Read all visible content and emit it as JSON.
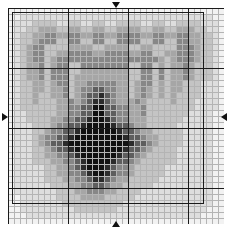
{
  "document": {
    "title": "Cross Stitch Pattern Chart",
    "kind": "counted-cross-stitch-grid-chart"
  },
  "grid": {
    "columns": 36,
    "rows": 36,
    "cell_size_px": 6,
    "origin_x_px": 8,
    "origin_y_px": 8,
    "bold_line_every": 10,
    "thin_line_color": "#b4b4b4",
    "bold_line_color": "#1a1a1a",
    "background_color": "#ffffff"
  },
  "design_box": {
    "left_px": 20,
    "top_px": 20,
    "width_px": 192,
    "height_px": 192,
    "border_color": "#1a1a1a",
    "label": "design-border"
  },
  "center_markers": {
    "top": {
      "direction": "down",
      "label": "center-column-marker-top"
    },
    "bottom": {
      "direction": "up",
      "label": "center-column-marker-bottom"
    },
    "left": {
      "direction": "right",
      "label": "center-row-marker-left"
    },
    "right": {
      "direction": "left",
      "label": "center-row-marker-right"
    }
  },
  "palette": {
    "0": "#ffffff",
    "1": "#f2f2f2",
    "2": "#dedede",
    "3": "#c4c4c4",
    "4": "#a6a6a6",
    "5": "#878787",
    "6": "#5e5e5e",
    "7": "#2b2b2b",
    "8": "#111111"
  },
  "palette_names": {
    "0": "white",
    "1": "near-white",
    "2": "very-light-gray",
    "3": "light-gray",
    "4": "mid-light-gray",
    "5": "mid-gray",
    "6": "dark-gray",
    "7": "very-dark-gray",
    "8": "black"
  },
  "chart_data": {
    "type": "heatmap",
    "xlabel": "",
    "ylabel": "",
    "grid": true,
    "legend": "none",
    "shades": 9,
    "rows": [
      "111111111111111111111111111111111111",
      "112222222222222222222222222222222211",
      "122233332233223322333322332233332221",
      "122334443344334433444433443344433221",
      "123344554455445544555544554455443321",
      "123345553355335533555533553355443321",
      "123455333344443344443344333355543321",
      "123455334455554455554455334455543321",
      "123455345555555555555555543455543321",
      "123445345533555555553355343445433321",
      "123445355533444444443355353445433321",
      "123445355534444444443355353445433321",
      "123344345534455555443455343443332221",
      "123344344534556655443454343443332221",
      "123343344534566765443454343433332221",
      "123343334454567765444543333433322221",
      "123333334455668866554453333333322221",
      "122333334455668866554453333333222211",
      "122333344556678876554443333332222211",
      "122233345566788887665443333322222211",
      "122233455667888888766544333332222211",
      "122234556678888888876654433332222211",
      "122234566788888888887665433332222211",
      "122233456678888888876654333322222211",
      "122233445567888888766543333322222211",
      "122233344556788887665433333322222211",
      "122222334456788876554333332222222211",
      "122222334455678876554333332222222211",
      "122222333445567765443333322222222211",
      "122222233344556654433333222222222211",
      "122222223334455544333322222222222211",
      "112222223333444433333222222222222211",
      "112222222333333333322222222222222211",
      "112222222223333333222222222222222111",
      "111222222222222222222222222222221111",
      "111111111111111111111111111111111111"
    ]
  }
}
